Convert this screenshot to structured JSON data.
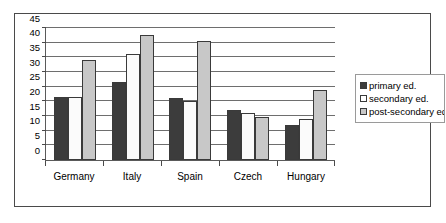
{
  "chart_data": {
    "type": "bar",
    "title": "",
    "subtitle": "",
    "xlabel": "",
    "ylabel": "",
    "categories": [
      "Germany",
      "Italy",
      "Spain",
      "Czech",
      "Hungary"
    ],
    "series": [
      {
        "name": "primary ed.",
        "color": "#3c3c3c",
        "values": [
          21.5,
          26.5,
          21,
          17,
          12
        ]
      },
      {
        "name": "secondary ed.",
        "color": "#fbfbfb",
        "values": [
          21.5,
          36,
          20,
          16,
          14
        ]
      },
      {
        "name": "post-secondary ed",
        "color": "#c8c8c8",
        "values": [
          34,
          42.5,
          40.5,
          14.5,
          24
        ]
      }
    ],
    "ylim": [
      0,
      45
    ],
    "yticks": [
      0,
      5,
      10,
      15,
      20,
      25,
      30,
      35,
      40,
      45
    ],
    "ytick_labels": [
      "0",
      "5",
      "10",
      "15",
      "20",
      "25",
      "30",
      "35",
      "40",
      "45"
    ],
    "grid": true,
    "grid_axis": "y",
    "legend_position": "right",
    "legend": [
      "primary ed.",
      "secondary ed.",
      "post-secondary ed"
    ],
    "annotations": []
  }
}
